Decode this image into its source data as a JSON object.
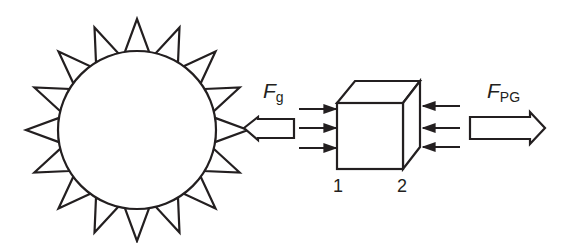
{
  "diagram": {
    "type": "physics force diagram",
    "colors": {
      "stroke": "#231f20",
      "background": "#ffffff"
    },
    "sun": {
      "label": "",
      "spike_count": 16
    },
    "gravity_force": {
      "symbol": "F",
      "subscript": "g",
      "direction": "toward sun (left)"
    },
    "radiation_pressure_force": {
      "symbol": "F",
      "subscript": "PG",
      "direction": "away from sun (right)"
    },
    "cube": {
      "face_labels": {
        "left": "1",
        "right": "2"
      },
      "arrows_left_face": 3,
      "arrows_right_face": 3
    }
  }
}
